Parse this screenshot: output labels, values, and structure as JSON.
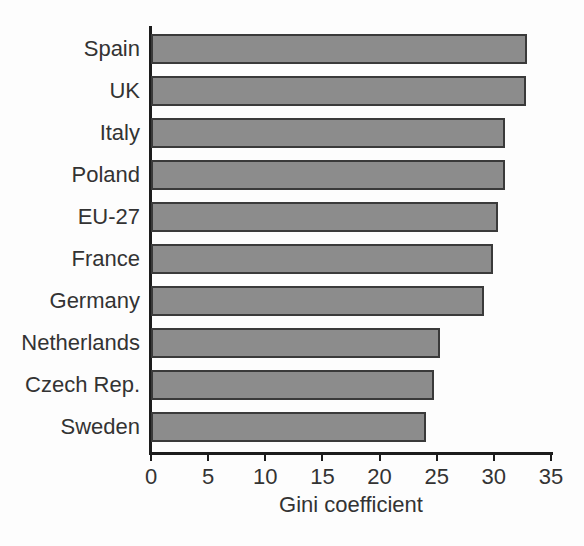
{
  "chart_data": {
    "type": "bar",
    "orientation": "horizontal",
    "title": "",
    "subtitle": "",
    "xlabel": "Gini coefficient",
    "ylabel": "",
    "xlim": [
      0,
      35
    ],
    "xticks": [
      0,
      5,
      10,
      15,
      20,
      25,
      30,
      35
    ],
    "xtick_labels": [
      "0",
      "5",
      "10",
      "15",
      "20",
      "25",
      "30",
      "35"
    ],
    "grid": false,
    "legend": null,
    "categories": [
      "Spain",
      "UK",
      "Italy",
      "Poland",
      "EU-27",
      "France",
      "Germany",
      "Netherlands",
      "Czech Rep.",
      "Sweden"
    ],
    "values": [
      32.9,
      32.8,
      31.0,
      31.0,
      30.4,
      29.9,
      29.1,
      25.3,
      24.8,
      24.1
    ],
    "bar_color": "#8c8c8c",
    "bar_edge_color": "#3a3a3a",
    "axis_color": "#1c1c1c",
    "background_color": "#fdfdfd"
  },
  "figure": {
    "title_clipped": "",
    "subtitle_ghost": ""
  }
}
